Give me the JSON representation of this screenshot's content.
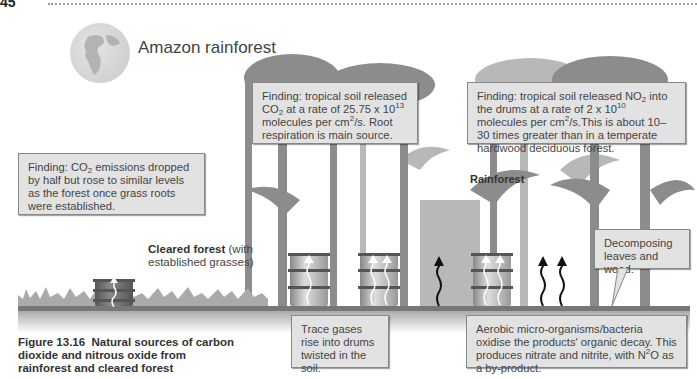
{
  "header": {
    "page_number": "45"
  },
  "labels": {
    "location_title": "Amazon rainforest",
    "cleared_forest_bold": "Cleared forest",
    "cleared_forest_rest": " (with established grasses)",
    "rainforest": "Rainforest"
  },
  "boxes": {
    "co2_finding": {
      "pre": "Finding: tropical soil released CO",
      "sub": "2",
      "mid": " at a rate of 25.75 x 10",
      "sup": "13",
      "mid2": " molecules per cm",
      "sup2": "2",
      "post": "/s. Root respiration is main source."
    },
    "no2_finding": {
      "pre": "Finding: tropical soil released NO",
      "sub": "2",
      "mid": " into the drums at a rate of 2 x 10",
      "sup": "10",
      "mid2": " molecules per cm",
      "sup2": "2",
      "post": "/s.This is about 10–30 times greater than in a temperate hardwood deciduous forest."
    },
    "cleared_finding": {
      "pre": "Finding: CO",
      "sub": "2",
      "post": " emissions dropped by half but rose to similar levels as the forest once grass roots were established."
    },
    "decomposing": "Decomposing leaves and wood.",
    "trace_gases": "Trace gases rise into drums twisted in the soil.",
    "aerobic": {
      "pre": "Aerobic micro-organisms/bacteria oxidise the products' organic decay. This produces nitrate and nitrite, with N",
      "sup": "2",
      "post": "O as a by-product."
    }
  },
  "caption": {
    "figure_label": "Figure 13.16",
    "text": "Natural sources of carbon dioxide and nitrous oxide from rainforest and cleared forest"
  },
  "colors": {
    "box_fill": "#e2e2e2",
    "box_border": "#888888",
    "tree_gray": "#8c8c8c",
    "tree_light": "#b5b5b5",
    "ground": "#777777"
  }
}
